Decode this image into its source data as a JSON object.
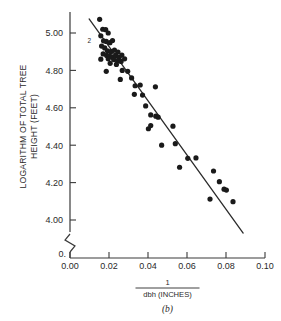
{
  "figure": {
    "caption": "(b)",
    "annotation_overlap": "2",
    "zero_origin_label": "0."
  },
  "chart_data": {
    "type": "scatter",
    "title": "",
    "xlabel_numerator": "1",
    "xlabel_denominator": "dbh (INCHES)",
    "ylabel_line1": "LOGARITHM OF TOTAL TREE",
    "ylabel_line2": "HEIGHT (FEET)",
    "xlim": [
      0.0,
      0.1
    ],
    "ylim": [
      4.0,
      5.08
    ],
    "xticks": [
      0.0,
      0.02,
      0.04,
      0.06,
      0.08,
      0.1
    ],
    "xticklabels": [
      "0.00",
      "0.02",
      "0.04",
      "0.06",
      "0.08",
      "0.10"
    ],
    "yticks": [
      4.0,
      4.2,
      4.4,
      4.6,
      4.8,
      5.0
    ],
    "yticklabels": [
      "4.00",
      "4.20",
      "4.40",
      "4.60",
      "4.80",
      "5.00"
    ],
    "grid": false,
    "legend": null,
    "axis_break_y": true,
    "axis_break_note": "y axis broken between 0 and 4.00",
    "point_color": "#1a1a1a",
    "line_color": "#2b2b2b",
    "fit_line": {
      "name": "least-squares fit",
      "x": [
        0.0098,
        0.0888
      ],
      "y": [
        5.075,
        3.93
      ]
    },
    "annotations": [
      {
        "text": "2",
        "x": 0.014,
        "y": 4.955,
        "note": "two coincident points"
      }
    ],
    "points": [
      {
        "x": 0.0152,
        "y": 5.073
      },
      {
        "x": 0.0168,
        "y": 5.02
      },
      {
        "x": 0.0183,
        "y": 5.018
      },
      {
        "x": 0.0196,
        "y": 5.0
      },
      {
        "x": 0.0158,
        "y": 4.985
      },
      {
        "x": 0.0172,
        "y": 4.958
      },
      {
        "x": 0.0186,
        "y": 4.955
      },
      {
        "x": 0.0205,
        "y": 4.948
      },
      {
        "x": 0.0218,
        "y": 4.96
      },
      {
        "x": 0.0162,
        "y": 4.93
      },
      {
        "x": 0.0178,
        "y": 4.92
      },
      {
        "x": 0.0192,
        "y": 4.905
      },
      {
        "x": 0.021,
        "y": 4.9
      },
      {
        "x": 0.0228,
        "y": 4.908
      },
      {
        "x": 0.0246,
        "y": 4.898
      },
      {
        "x": 0.017,
        "y": 4.888
      },
      {
        "x": 0.0188,
        "y": 4.88
      },
      {
        "x": 0.0202,
        "y": 4.878
      },
      {
        "x": 0.0216,
        "y": 4.872
      },
      {
        "x": 0.0234,
        "y": 4.88
      },
      {
        "x": 0.0252,
        "y": 4.87
      },
      {
        "x": 0.0266,
        "y": 4.882
      },
      {
        "x": 0.0158,
        "y": 4.86
      },
      {
        "x": 0.0196,
        "y": 4.862
      },
      {
        "x": 0.0224,
        "y": 4.858
      },
      {
        "x": 0.0244,
        "y": 4.852
      },
      {
        "x": 0.0262,
        "y": 4.848
      },
      {
        "x": 0.028,
        "y": 4.862
      },
      {
        "x": 0.0206,
        "y": 4.838
      },
      {
        "x": 0.0238,
        "y": 4.832
      },
      {
        "x": 0.0186,
        "y": 4.795
      },
      {
        "x": 0.0268,
        "y": 4.8
      },
      {
        "x": 0.0296,
        "y": 4.795
      },
      {
        "x": 0.0258,
        "y": 4.752
      },
      {
        "x": 0.0316,
        "y": 4.76
      },
      {
        "x": 0.0334,
        "y": 4.718
      },
      {
        "x": 0.036,
        "y": 4.722
      },
      {
        "x": 0.0438,
        "y": 4.712
      },
      {
        "x": 0.033,
        "y": 4.672
      },
      {
        "x": 0.0372,
        "y": 4.668
      },
      {
        "x": 0.0388,
        "y": 4.61
      },
      {
        "x": 0.0414,
        "y": 4.562
      },
      {
        "x": 0.044,
        "y": 4.555
      },
      {
        "x": 0.0452,
        "y": 4.55
      },
      {
        "x": 0.0402,
        "y": 4.488
      },
      {
        "x": 0.0414,
        "y": 4.505
      },
      {
        "x": 0.0528,
        "y": 4.502
      },
      {
        "x": 0.047,
        "y": 4.4
      },
      {
        "x": 0.054,
        "y": 4.408
      },
      {
        "x": 0.0562,
        "y": 4.282
      },
      {
        "x": 0.0604,
        "y": 4.33
      },
      {
        "x": 0.0646,
        "y": 4.332
      },
      {
        "x": 0.0736,
        "y": 4.262
      },
      {
        "x": 0.0766,
        "y": 4.205
      },
      {
        "x": 0.079,
        "y": 4.165
      },
      {
        "x": 0.0802,
        "y": 4.16
      },
      {
        "x": 0.0718,
        "y": 4.112
      },
      {
        "x": 0.0836,
        "y": 4.098
      }
    ]
  }
}
